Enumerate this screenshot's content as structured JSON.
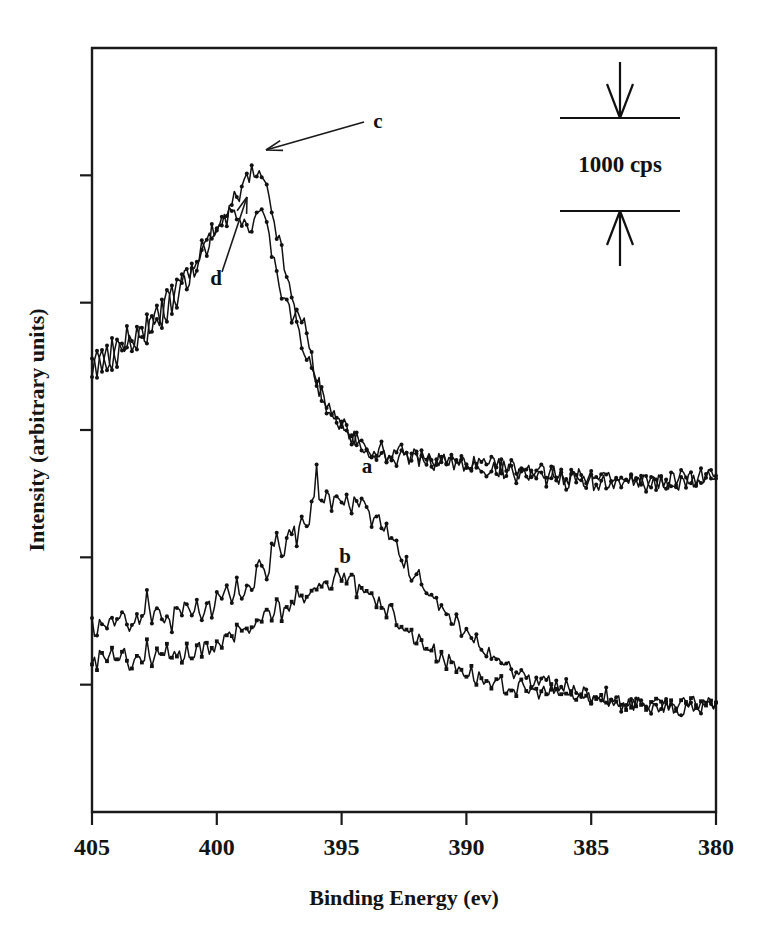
{
  "figure": {
    "name": "xps-n1s-spectra",
    "background": "#ffffff",
    "ink_color": "#111111"
  },
  "chart_data": {
    "type": "line",
    "title": "",
    "subtitle": "",
    "xlabel": "Binding Energy (ev)",
    "ylabel": "Intensity (arbitrary units)",
    "xlim": [
      405,
      380
    ],
    "x_reversed": true,
    "xticks": [
      405,
      400,
      395,
      390,
      385,
      380
    ],
    "xticklabels": [
      "405",
      "400",
      "395",
      "390",
      "385",
      "380"
    ],
    "ylim": [
      0,
      6
    ],
    "yticks": [
      0,
      1,
      2,
      3,
      4,
      5
    ],
    "yticklabels": [
      "",
      "",
      "",
      "",
      "",
      ""
    ],
    "y_units": "counts per second (cps)",
    "grid": false,
    "legend_position": "inline-annotations",
    "scale_bar": {
      "label": "1000 cps",
      "value": 1000,
      "units": "cps",
      "orientation": "vertical",
      "top_arrow": "down-arrow-icon",
      "bottom_arrow": "up-arrow-icon"
    },
    "annotations": [
      {
        "text": "c",
        "points_to": "upper-trace-c-peak",
        "x_label": 397.0,
        "arrow": true
      },
      {
        "text": "d",
        "points_to": "upper-trace-d-peak",
        "x_label": 399.8,
        "arrow": true
      },
      {
        "text": "a",
        "points_to": "lower-trace-a",
        "x_label": 393.5,
        "arrow": false
      },
      {
        "text": "b",
        "points_to": "lower-trace-b",
        "x_label": 394.1,
        "arrow": false
      }
    ],
    "series": [
      {
        "name": "a",
        "label": "a",
        "marker": "circle",
        "group": "lower-pair",
        "description": "N 1s spectrum, lower pair upper trace, peak near 396 eV",
        "peak_x": 396.0,
        "x": [
          405.0,
          404.8,
          404.6,
          404.4,
          404.2,
          404.0,
          403.8,
          403.6,
          403.4,
          403.2,
          403.0,
          402.8,
          402.6,
          402.4,
          402.2,
          402.0,
          401.8,
          401.6,
          401.4,
          401.2,
          401.0,
          400.8,
          400.6,
          400.4,
          400.2,
          400.0,
          399.8,
          399.6,
          399.4,
          399.2,
          399.0,
          398.8,
          398.6,
          398.4,
          398.2,
          398.0,
          397.8,
          397.6,
          397.4,
          397.2,
          397.0,
          396.8,
          396.6,
          396.4,
          396.2,
          396.0,
          395.8,
          395.6,
          395.4,
          395.2,
          395.0,
          394.8,
          394.6,
          394.4,
          394.2,
          394.0,
          393.8,
          393.6,
          393.4,
          393.2,
          393.0,
          392.8,
          392.6,
          392.4,
          392.2,
          392.0,
          391.8,
          391.6,
          391.4,
          391.2,
          391.0,
          390.8,
          390.6,
          390.4,
          390.2,
          390.0,
          389.8,
          389.6,
          389.4,
          389.2,
          389.0,
          388.8,
          388.6,
          388.4,
          388.2,
          388.0,
          387.8,
          387.6,
          387.4,
          387.2,
          387.0,
          386.8,
          386.6,
          386.4,
          386.2,
          386.0,
          385.8,
          385.6,
          385.4,
          385.2,
          385.0,
          384.8,
          384.6,
          384.4,
          384.2,
          384.0,
          383.8,
          383.6,
          383.4,
          383.2,
          383.0,
          382.8,
          382.6,
          382.4,
          382.2,
          382.0,
          381.8,
          381.6,
          381.4,
          381.2,
          381.0,
          380.8,
          380.6,
          380.4,
          380.2,
          380.0
        ],
        "y": [
          1.47,
          1.4,
          1.52,
          1.44,
          1.56,
          1.46,
          1.61,
          1.5,
          1.44,
          1.58,
          1.49,
          1.7,
          1.52,
          1.62,
          1.5,
          1.58,
          1.47,
          1.62,
          1.53,
          1.66,
          1.55,
          1.63,
          1.52,
          1.68,
          1.58,
          1.7,
          1.62,
          1.74,
          1.63,
          1.78,
          1.7,
          1.8,
          1.72,
          1.88,
          1.96,
          1.84,
          2.05,
          2.15,
          2.02,
          2.12,
          2.22,
          2.14,
          2.3,
          2.2,
          2.4,
          2.66,
          2.38,
          2.48,
          2.42,
          2.55,
          2.44,
          2.52,
          2.38,
          2.5,
          2.4,
          2.46,
          2.3,
          2.34,
          2.2,
          2.24,
          2.1,
          2.12,
          2.0,
          1.96,
          1.88,
          1.9,
          1.78,
          1.74,
          1.66,
          1.7,
          1.58,
          1.56,
          1.46,
          1.5,
          1.4,
          1.42,
          1.32,
          1.34,
          1.24,
          1.28,
          1.2,
          1.22,
          1.14,
          1.18,
          1.1,
          1.12,
          1.06,
          1.1,
          1.02,
          1.06,
          0.99,
          1.04,
          0.98,
          1.02,
          0.96,
          1.0,
          0.94,
          0.98,
          0.92,
          0.96,
          0.9,
          0.94,
          0.88,
          0.92,
          0.86,
          0.9,
          0.84,
          0.88,
          0.83,
          0.87,
          0.82,
          0.86,
          0.81,
          0.85,
          0.8,
          0.84,
          0.8,
          0.83,
          0.8,
          0.83,
          0.81,
          0.84,
          0.82,
          0.85,
          0.83,
          0.86
        ]
      },
      {
        "name": "b",
        "label": "b",
        "marker": "square",
        "group": "lower-pair",
        "description": "N 1s spectrum, lower pair lower trace, broad peak near 395 eV",
        "peak_x": 395.0,
        "x": [
          405.0,
          404.8,
          404.6,
          404.4,
          404.2,
          404.0,
          403.8,
          403.6,
          403.4,
          403.2,
          403.0,
          402.8,
          402.6,
          402.4,
          402.2,
          402.0,
          401.8,
          401.6,
          401.4,
          401.2,
          401.0,
          400.8,
          400.6,
          400.4,
          400.2,
          400.0,
          399.8,
          399.6,
          399.4,
          399.2,
          399.0,
          398.8,
          398.6,
          398.4,
          398.2,
          398.0,
          397.8,
          397.6,
          397.4,
          397.2,
          397.0,
          396.8,
          396.6,
          396.4,
          396.2,
          396.0,
          395.8,
          395.6,
          395.4,
          395.2,
          395.0,
          394.8,
          394.6,
          394.4,
          394.2,
          394.0,
          393.8,
          393.6,
          393.4,
          393.2,
          393.0,
          392.8,
          392.6,
          392.4,
          392.2,
          392.0,
          391.8,
          391.6,
          391.4,
          391.2,
          391.0,
          390.8,
          390.6,
          390.4,
          390.2,
          390.0,
          389.8,
          389.6,
          389.4,
          389.2,
          389.0,
          388.8,
          388.6,
          388.4,
          388.2,
          388.0,
          387.8,
          387.6,
          387.4,
          387.2,
          387.0,
          386.8,
          386.6,
          386.4,
          386.2,
          386.0,
          385.8,
          385.6,
          385.4,
          385.2,
          385.0,
          384.8,
          384.6,
          384.4,
          384.2,
          384.0,
          383.8,
          383.6,
          383.4,
          383.2,
          383.0,
          382.8,
          382.6,
          382.4,
          382.2,
          382.0,
          381.8,
          381.6,
          381.4,
          381.2,
          381.0,
          380.8,
          380.6,
          380.4,
          380.2,
          380.0
        ],
        "y": [
          1.22,
          1.16,
          1.26,
          1.18,
          1.28,
          1.2,
          1.3,
          1.22,
          1.12,
          1.26,
          1.18,
          1.3,
          1.2,
          1.28,
          1.18,
          1.26,
          1.17,
          1.28,
          1.19,
          1.3,
          1.22,
          1.31,
          1.23,
          1.34,
          1.26,
          1.36,
          1.3,
          1.4,
          1.34,
          1.44,
          1.38,
          1.48,
          1.42,
          1.52,
          1.46,
          1.56,
          1.52,
          1.62,
          1.56,
          1.66,
          1.6,
          1.7,
          1.64,
          1.74,
          1.68,
          1.78,
          1.72,
          1.84,
          1.78,
          1.9,
          1.86,
          1.8,
          1.88,
          1.74,
          1.82,
          1.7,
          1.74,
          1.62,
          1.66,
          1.56,
          1.58,
          1.46,
          1.5,
          1.4,
          1.42,
          1.34,
          1.36,
          1.28,
          1.3,
          1.22,
          1.24,
          1.17,
          1.19,
          1.12,
          1.14,
          1.08,
          1.1,
          1.04,
          1.06,
          1.01,
          1.03,
          0.99,
          1.01,
          0.97,
          0.99,
          0.95,
          0.98,
          0.94,
          0.97,
          0.93,
          0.96,
          0.92,
          0.95,
          0.91,
          0.94,
          0.9,
          0.93,
          0.89,
          0.92,
          0.88,
          0.91,
          0.87,
          0.9,
          0.86,
          0.89,
          0.85,
          0.88,
          0.84,
          0.87,
          0.84,
          0.87,
          0.83,
          0.86,
          0.83,
          0.86,
          0.82,
          0.85,
          0.82,
          0.85,
          0.83,
          0.86,
          0.84,
          0.87,
          0.85,
          0.88,
          0.86
        ]
      },
      {
        "name": "c",
        "label": "c",
        "marker": "circle",
        "group": "upper-pair",
        "description": "N 1s spectrum, upper pair, flat-topped peak near 398.5 eV",
        "peak_x": 398.6,
        "x": [
          405.0,
          404.8,
          404.6,
          404.4,
          404.2,
          404.0,
          403.8,
          403.6,
          403.4,
          403.2,
          403.0,
          402.8,
          402.6,
          402.4,
          402.2,
          402.0,
          401.8,
          401.6,
          401.4,
          401.2,
          401.0,
          400.8,
          400.6,
          400.4,
          400.2,
          400.0,
          399.8,
          399.6,
          399.4,
          399.2,
          399.0,
          398.8,
          398.6,
          398.4,
          398.2,
          398.0,
          397.8,
          397.6,
          397.4,
          397.2,
          397.0,
          396.8,
          396.6,
          396.4,
          396.2,
          396.0,
          395.8,
          395.6,
          395.4,
          395.2,
          395.0,
          394.8,
          394.6,
          394.4,
          394.2,
          394.0,
          393.8,
          393.6,
          393.4,
          393.2,
          393.0,
          392.8,
          392.6,
          392.4,
          392.2,
          392.0,
          391.8,
          391.6,
          391.4,
          391.2,
          391.0,
          390.8,
          390.6,
          390.4,
          390.2,
          390.0,
          389.8,
          389.6,
          389.4,
          389.2,
          389.0,
          388.8,
          388.6,
          388.4,
          388.2,
          388.0,
          387.8,
          387.6,
          387.4,
          387.2,
          387.0,
          386.8,
          386.6,
          386.4,
          386.2,
          386.0,
          385.8,
          385.6,
          385.4,
          385.2,
          385.0,
          384.8,
          384.6,
          384.4,
          384.2,
          384.0,
          383.8,
          383.6,
          383.4,
          383.2,
          383.0,
          382.8,
          382.6,
          382.4,
          382.2,
          382.0,
          381.8,
          381.6,
          381.4,
          381.2,
          381.0,
          380.8,
          380.6,
          380.4,
          380.2,
          380.0
        ],
        "y": [
          3.52,
          3.44,
          3.58,
          3.5,
          3.66,
          3.56,
          3.7,
          3.6,
          3.76,
          3.66,
          3.82,
          3.72,
          3.9,
          3.8,
          3.98,
          3.9,
          4.08,
          4.02,
          4.18,
          4.12,
          4.3,
          4.24,
          4.42,
          4.38,
          4.55,
          4.52,
          4.68,
          4.66,
          4.8,
          4.78,
          4.9,
          4.96,
          5.0,
          4.98,
          4.96,
          4.86,
          4.72,
          4.56,
          4.38,
          4.2,
          4.02,
          3.86,
          3.7,
          3.56,
          3.46,
          3.36,
          3.28,
          3.2,
          3.14,
          3.08,
          3.02,
          2.98,
          2.94,
          2.9,
          2.88,
          2.84,
          2.86,
          2.82,
          2.84,
          2.8,
          2.83,
          2.79,
          2.82,
          2.78,
          2.81,
          2.77,
          2.8,
          2.76,
          2.79,
          2.75,
          2.78,
          2.74,
          2.77,
          2.73,
          2.76,
          2.72,
          2.75,
          2.71,
          2.74,
          2.7,
          2.73,
          2.69,
          2.72,
          2.68,
          2.71,
          2.67,
          2.7,
          2.66,
          2.69,
          2.65,
          2.68,
          2.64,
          2.67,
          2.63,
          2.66,
          2.62,
          2.65,
          2.61,
          2.64,
          2.6,
          2.63,
          2.6,
          2.63,
          2.59,
          2.62,
          2.59,
          2.62,
          2.58,
          2.61,
          2.58,
          2.61,
          2.58,
          2.61,
          2.58,
          2.61,
          2.59,
          2.62,
          2.6,
          2.63,
          2.61,
          2.64,
          2.62,
          2.65,
          2.63,
          2.66,
          2.64
        ]
      },
      {
        "name": "d",
        "label": "d",
        "marker": "triangle",
        "group": "upper-pair",
        "description": "N 1s spectrum, upper pair, peak shifted to near 399.3 eV with dip at 398.8 eV",
        "peak_x": 399.4,
        "x": [
          405.0,
          404.8,
          404.6,
          404.4,
          404.2,
          404.0,
          403.8,
          403.6,
          403.4,
          403.2,
          403.0,
          402.8,
          402.6,
          402.4,
          402.2,
          402.0,
          401.8,
          401.6,
          401.4,
          401.2,
          401.0,
          400.8,
          400.6,
          400.4,
          400.2,
          400.0,
          399.8,
          399.6,
          399.4,
          399.2,
          399.0,
          398.8,
          398.6,
          398.4,
          398.2,
          398.0,
          397.8,
          397.6,
          397.4,
          397.2,
          397.0,
          396.8,
          396.6,
          396.4,
          396.2,
          396.0,
          395.8,
          395.6,
          395.4,
          395.2,
          395.0,
          394.8,
          394.6,
          394.4,
          394.2,
          394.0,
          393.8,
          393.6,
          393.4,
          393.2,
          393.0,
          392.8,
          392.6,
          392.4,
          392.2,
          392.0,
          391.8,
          391.6,
          391.4,
          391.2,
          391.0,
          390.8,
          390.6,
          390.4,
          390.2,
          390.0,
          389.8,
          389.6,
          389.4,
          389.2,
          389.0,
          388.8,
          388.6,
          388.4,
          388.2,
          388.0,
          387.8,
          387.6,
          387.4,
          387.2,
          387.0,
          386.8,
          386.6,
          386.4,
          386.2,
          386.0,
          385.8,
          385.6,
          385.4,
          385.2,
          385.0,
          384.8,
          384.6,
          384.4,
          384.2,
          384.0,
          383.8,
          383.6,
          383.4,
          383.2,
          383.0,
          382.8,
          382.6,
          382.4,
          382.2,
          382.0,
          381.8,
          381.6,
          381.4,
          381.2,
          381.0,
          380.8,
          380.6,
          380.4,
          380.2,
          380.0
        ],
        "y": [
          3.46,
          3.56,
          3.48,
          3.62,
          3.52,
          3.68,
          3.58,
          3.74,
          3.64,
          3.8,
          3.7,
          3.88,
          3.78,
          3.96,
          3.88,
          4.06,
          3.98,
          4.16,
          4.1,
          4.28,
          4.2,
          4.4,
          4.34,
          4.54,
          4.48,
          4.66,
          4.62,
          4.76,
          4.8,
          4.72,
          4.6,
          4.66,
          4.58,
          4.72,
          4.66,
          4.56,
          4.42,
          4.24,
          4.08,
          3.96,
          3.86,
          3.96,
          3.9,
          3.72,
          3.54,
          3.4,
          3.3,
          3.22,
          3.16,
          3.1,
          3.04,
          3.0,
          2.96,
          2.92,
          2.9,
          2.86,
          2.84,
          2.8,
          2.82,
          2.78,
          2.81,
          2.77,
          2.8,
          2.76,
          2.79,
          2.75,
          2.78,
          2.74,
          2.77,
          2.73,
          2.76,
          2.72,
          2.75,
          2.71,
          2.74,
          2.7,
          2.73,
          2.69,
          2.72,
          2.68,
          2.71,
          2.67,
          2.7,
          2.66,
          2.69,
          2.65,
          2.68,
          2.64,
          2.67,
          2.63,
          2.66,
          2.62,
          2.65,
          2.61,
          2.64,
          2.6,
          2.63,
          2.59,
          2.62,
          2.58,
          2.61,
          2.58,
          2.61,
          2.57,
          2.6,
          2.57,
          2.6,
          2.56,
          2.59,
          2.56,
          2.59,
          2.56,
          2.59,
          2.56,
          2.59,
          2.57,
          2.6,
          2.58,
          2.61,
          2.59,
          2.62,
          2.6,
          2.63,
          2.61,
          2.64,
          2.62
        ]
      }
    ]
  }
}
